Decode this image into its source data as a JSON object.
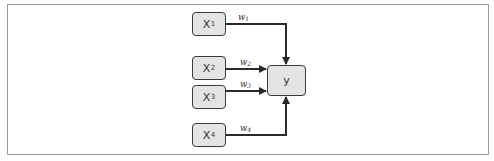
{
  "diagram": {
    "type": "perceptron-weighted-sum",
    "inputs": [
      {
        "id": "x1",
        "label": "X",
        "subscript": "1",
        "weight": {
          "label": "w",
          "subscript": "1"
        }
      },
      {
        "id": "x2",
        "label": "X",
        "subscript": "2",
        "weight": {
          "label": "w",
          "subscript": "2"
        }
      },
      {
        "id": "x3",
        "label": "X",
        "subscript": "3",
        "weight": {
          "label": "w",
          "subscript": "3"
        }
      },
      {
        "id": "x4",
        "label": "X",
        "subscript": "4",
        "weight": {
          "label": "w",
          "subscript": "4"
        }
      }
    ],
    "output": {
      "id": "y",
      "label": "y"
    },
    "edges": [
      {
        "from": "x1",
        "to": "y",
        "weight": "w1"
      },
      {
        "from": "x2",
        "to": "y",
        "weight": "w2"
      },
      {
        "from": "x3",
        "to": "y",
        "weight": "w3"
      },
      {
        "from": "x4",
        "to": "y",
        "weight": "w4"
      }
    ]
  },
  "colors": {
    "node_fill": "#e4e4e4",
    "node_border": "#3a3a3a",
    "edge": "#2a2a2a",
    "frame": "#9a9a9a"
  }
}
